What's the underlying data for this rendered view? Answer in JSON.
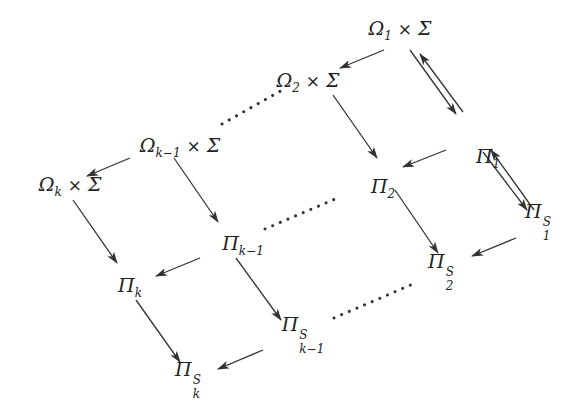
{
  "diagram": {
    "type": "commutative-diagram",
    "colors": {
      "stroke": "#333333",
      "text": "#222222",
      "background": "#ffffff"
    },
    "nodes": [
      {
        "id": "omega1_sigma",
        "base": "Ω",
        "sub": "1",
        "times": "×",
        "rhs": "Σ",
        "x": 400,
        "y": 30
      },
      {
        "id": "omega2_sigma",
        "base": "Ω",
        "sub": "2",
        "times": "×",
        "rhs": "Σ",
        "x": 308,
        "y": 82
      },
      {
        "id": "omegak1_sigma",
        "base": "Ω",
        "sub": "k−1",
        "times": "×",
        "rhs": "Σ",
        "x": 180,
        "y": 147
      },
      {
        "id": "omegak_sigma",
        "base": "Ω",
        "sub": "k",
        "times": "×",
        "rhs": "Σ",
        "x": 70,
        "y": 186
      },
      {
        "id": "pi1",
        "base": "Π",
        "sub": "1",
        "x": 488,
        "y": 158
      },
      {
        "id": "pi2",
        "base": "Π",
        "sub": "2",
        "x": 383,
        "y": 188
      },
      {
        "id": "pi1S",
        "base": "Π",
        "sup": "S",
        "sub": "1",
        "x": 538,
        "y": 222
      },
      {
        "id": "pik1",
        "base": "Π",
        "sub": "k−1",
        "x": 243,
        "y": 245
      },
      {
        "id": "pi2S",
        "base": "Π",
        "sup": "S",
        "sub": "2",
        "x": 441,
        "y": 272
      },
      {
        "id": "pik",
        "base": "Π",
        "sub": "k",
        "x": 130,
        "y": 287
      },
      {
        "id": "pik1S",
        "base": "Π",
        "sup": "S",
        "sub": "k−1",
        "x": 303,
        "y": 335
      },
      {
        "id": "pikS",
        "base": "Π",
        "sup": "S",
        "sub": "k",
        "x": 188,
        "y": 380
      }
    ],
    "arrows": [
      {
        "from": "omega1_sigma",
        "to": "omega2_sigma",
        "x1": 384,
        "y1": 50,
        "x2": 340,
        "y2": 68
      },
      {
        "from": "omega1_sigma",
        "to": "pi1",
        "x1": 410,
        "y1": 50,
        "x2": 456,
        "y2": 114
      },
      {
        "from": "pi1",
        "to": "omega1_sigma",
        "x1": 463,
        "y1": 112,
        "x2": 420,
        "y2": 54
      },
      {
        "from": "omega2_sigma",
        "to": "pi2",
        "x1": 333,
        "y1": 95,
        "x2": 377,
        "y2": 158
      },
      {
        "from": "pi1",
        "to": "pi2",
        "x1": 446,
        "y1": 150,
        "x2": 403,
        "y2": 167
      },
      {
        "from": "pi1",
        "to": "pi1S",
        "x1": 483,
        "y1": 152,
        "x2": 527,
        "y2": 210
      },
      {
        "from": "pi1S",
        "to": "pi1",
        "x1": 534,
        "y1": 210,
        "x2": 491,
        "y2": 150
      },
      {
        "from": "pi2",
        "to": "pi2S",
        "x1": 395,
        "y1": 190,
        "x2": 438,
        "y2": 253
      },
      {
        "from": "pi1S",
        "to": "pi2S",
        "x1": 516,
        "y1": 238,
        "x2": 472,
        "y2": 256
      },
      {
        "from": "omegak1_sigma",
        "to": "omegak_sigma",
        "x1": 130,
        "y1": 158,
        "x2": 87,
        "y2": 176
      },
      {
        "from": "omegak1_sigma",
        "to": "pik1",
        "x1": 174,
        "y1": 158,
        "x2": 218,
        "y2": 222
      },
      {
        "from": "omegak_sigma",
        "to": "pik",
        "x1": 73,
        "y1": 200,
        "x2": 117,
        "y2": 263
      },
      {
        "from": "pik1",
        "to": "pik",
        "x1": 200,
        "y1": 258,
        "x2": 156,
        "y2": 276
      },
      {
        "from": "pik1",
        "to": "pik1S",
        "x1": 236,
        "y1": 258,
        "x2": 281,
        "y2": 320
      },
      {
        "from": "pik",
        "to": "pikS",
        "x1": 136,
        "y1": 300,
        "x2": 180,
        "y2": 362
      },
      {
        "from": "pik1S",
        "to": "pikS",
        "x1": 263,
        "y1": 350,
        "x2": 218,
        "y2": 369
      }
    ],
    "dotted": [
      {
        "from": "omegak1_sigma",
        "to": "omega2_sigma",
        "x1": 222,
        "y1": 124,
        "x2": 284,
        "y2": 89
      },
      {
        "from": "pik1",
        "to": "pi2",
        "x1": 265,
        "y1": 229,
        "x2": 335,
        "y2": 199
      },
      {
        "from": "pik1S",
        "to": "pi2S",
        "x1": 334,
        "y1": 318,
        "x2": 413,
        "y2": 284
      }
    ]
  }
}
